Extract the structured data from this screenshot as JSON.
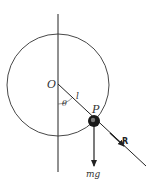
{
  "diagram": {
    "type": "pendulum-on-circle",
    "labels": {
      "origin": "O",
      "length": "l",
      "angle": "θ",
      "point": "P",
      "reaction": "R",
      "weight": "mg"
    },
    "colors": {
      "line": "#222222",
      "ball": "#1a1a1a",
      "background": "#ffffff"
    }
  }
}
